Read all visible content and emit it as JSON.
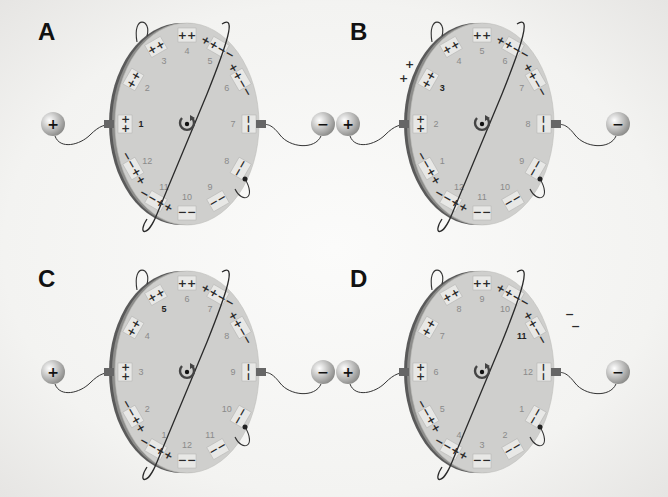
{
  "figure": {
    "type": "electrostatic rotating disc diagram",
    "background": "#f4f4f2",
    "disc_color": "#cfcfcd",
    "rim_color": "#555555",
    "pad_color": "#e8e8e6"
  },
  "panels": [
    {
      "label": "A",
      "positive_terminal": "+",
      "negative_terminal": "−",
      "rotation_icon": "clockwise-rotation-arrow",
      "highlighted_segments": [
        "1"
      ],
      "segments": [
        {
          "num": "1",
          "charges": "+ +"
        },
        {
          "num": "2",
          "charges": "+ +"
        },
        {
          "num": "3",
          "charges": "+ +"
        },
        {
          "num": "4",
          "charges": "+ +"
        },
        {
          "num": "5",
          "charges": "+ + − −"
        },
        {
          "num": "6",
          "charges": "+ + − −"
        },
        {
          "num": "7",
          "charges": "− −"
        },
        {
          "num": "8",
          "charges": "− −"
        },
        {
          "num": "9",
          "charges": "− −"
        },
        {
          "num": "10",
          "charges": "− −"
        },
        {
          "num": "11",
          "charges": "+ + − −"
        },
        {
          "num": "12",
          "charges": "+ + − −"
        }
      ],
      "free_charges": []
    },
    {
      "label": "B",
      "positive_terminal": "+",
      "negative_terminal": "−",
      "rotation_icon": "clockwise-rotation-arrow",
      "highlighted_segments": [
        "3"
      ],
      "segments": [
        {
          "num": "2",
          "charges": "+ +"
        },
        {
          "num": "3",
          "charges": "+ +"
        },
        {
          "num": "4",
          "charges": "+ +"
        },
        {
          "num": "5",
          "charges": "+ +"
        },
        {
          "num": "6",
          "charges": "+ + − −"
        },
        {
          "num": "7",
          "charges": "+ + − −"
        },
        {
          "num": "8",
          "charges": "− −"
        },
        {
          "num": "9",
          "charges": "− −"
        },
        {
          "num": "10",
          "charges": "− −"
        },
        {
          "num": "11",
          "charges": "− −"
        },
        {
          "num": "12",
          "charges": "+ + − −"
        },
        {
          "num": "1",
          "charges": "+ + − −"
        }
      ],
      "free_charges": [
        "+",
        "+"
      ]
    },
    {
      "label": "C",
      "positive_terminal": "+",
      "negative_terminal": "−",
      "rotation_icon": "clockwise-rotation-arrow",
      "highlighted_segments": [
        "5"
      ],
      "segments": [
        {
          "num": "3",
          "charges": "+ +"
        },
        {
          "num": "4",
          "charges": "+ +"
        },
        {
          "num": "5",
          "charges": "+ +"
        },
        {
          "num": "6",
          "charges": "+ +"
        },
        {
          "num": "7",
          "charges": "+ + − −"
        },
        {
          "num": "8",
          "charges": "+ + − −"
        },
        {
          "num": "9",
          "charges": "− −"
        },
        {
          "num": "10",
          "charges": "− −"
        },
        {
          "num": "11",
          "charges": "− −"
        },
        {
          "num": "12",
          "charges": "− −"
        },
        {
          "num": "1",
          "charges": "+ + − −"
        },
        {
          "num": "2",
          "charges": "+ + − −"
        }
      ],
      "free_charges": []
    },
    {
      "label": "D",
      "positive_terminal": "+",
      "negative_terminal": "−",
      "rotation_icon": "clockwise-rotation-arrow",
      "highlighted_segments": [
        "11"
      ],
      "segments": [
        {
          "num": "6",
          "charges": "+ +"
        },
        {
          "num": "7",
          "charges": "+ +"
        },
        {
          "num": "8",
          "charges": "+ +"
        },
        {
          "num": "9",
          "charges": "+ +"
        },
        {
          "num": "10",
          "charges": "+ + − −"
        },
        {
          "num": "11",
          "charges": "+ + − −"
        },
        {
          "num": "12",
          "charges": "− −"
        },
        {
          "num": "1",
          "charges": "− −"
        },
        {
          "num": "2",
          "charges": "− −"
        },
        {
          "num": "3",
          "charges": "− −"
        },
        {
          "num": "4",
          "charges": "+ + − −"
        },
        {
          "num": "5",
          "charges": "+ + − −"
        }
      ],
      "free_charges": [
        "−",
        "−"
      ]
    }
  ]
}
